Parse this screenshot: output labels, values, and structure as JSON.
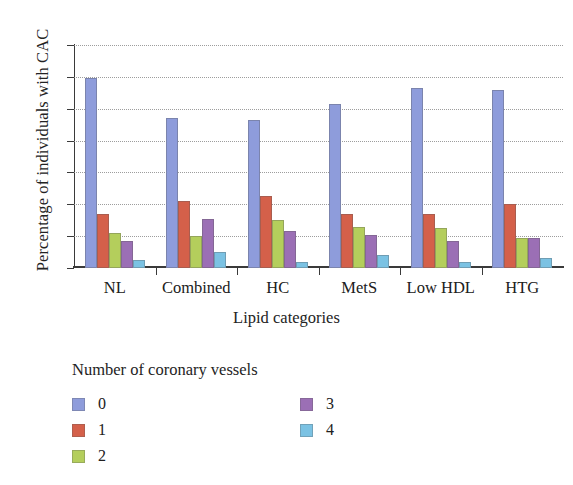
{
  "chart_data": {
    "type": "bar",
    "title": "",
    "xlabel": "Lipid categories",
    "ylabel": "Percentage of individuals with CAC",
    "ylim": [
      0,
      70
    ],
    "yticks": [
      0,
      10,
      20,
      30,
      40,
      50,
      60,
      70
    ],
    "grid": true,
    "grid_style": "dotted horizontal",
    "legend_title": "Number of coronary vessels",
    "legend_position": "below-plot, two columns",
    "categories": [
      "NL",
      "Combined",
      "HC",
      "MetS",
      "Low HDL",
      "HTG"
    ],
    "series": [
      {
        "name": "0",
        "color": "#8E9CDB",
        "values": [
          59.5,
          47.0,
          46.5,
          51.5,
          56.5,
          56.0
        ]
      },
      {
        "name": "1",
        "color": "#D4604A",
        "values": [
          17.0,
          21.0,
          22.5,
          17.0,
          17.0,
          20.0
        ]
      },
      {
        "name": "2",
        "color": "#B4CE5C",
        "values": [
          11.0,
          10.0,
          15.0,
          13.0,
          12.5,
          9.5
        ]
      },
      {
        "name": "3",
        "color": "#9B6FB5",
        "values": [
          8.5,
          15.5,
          11.5,
          10.5,
          8.5,
          9.5
        ]
      },
      {
        "name": "4",
        "color": "#7BC2E3",
        "values": [
          2.5,
          5.0,
          2.0,
          4.0,
          2.0,
          3.0
        ]
      }
    ]
  },
  "axes": {
    "y_title": "Percentage of individuals with CAC",
    "x_title": "Lipid categories",
    "y_tick_labels": [
      "70",
      "60",
      "50",
      "40",
      "30",
      "20",
      "10",
      "0"
    ],
    "x_tick_labels": [
      "NL",
      "Combined",
      "HC",
      "MetS",
      "Low HDL",
      "HTG"
    ]
  },
  "legend": {
    "title": "Number of coronary vessels",
    "column_left": [
      {
        "label": "0",
        "color": "#8E9CDB"
      },
      {
        "label": "1",
        "color": "#D4604A"
      },
      {
        "label": "2",
        "color": "#B4CE5C"
      }
    ],
    "column_right": [
      {
        "label": "3",
        "color": "#9B6FB5"
      },
      {
        "label": "4",
        "color": "#7BC2E3"
      }
    ]
  }
}
